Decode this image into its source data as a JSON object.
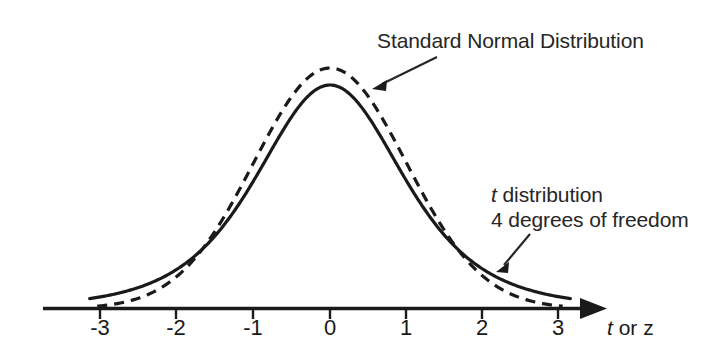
{
  "figure": {
    "background_color": "#ffffff",
    "ink_color": "#1a1a1a",
    "axis_title": "t or z",
    "axis_title_italic_part": "t",
    "axis_title_rest": " or z"
  },
  "annotations": {
    "normal_label": "Standard Normal Distribution",
    "t_label_line1_italic": "t",
    "t_label_line1_rest": " distribution",
    "t_label_line2": "4 degrees of freedom"
  },
  "chart_data": {
    "type": "line",
    "title": "",
    "subtitle": "",
    "xlabel": "t or z",
    "ylabel": "",
    "xlim": [
      -3.35,
      3.6
    ],
    "ylim": [
      0,
      0.435
    ],
    "grid": false,
    "legend_position": "annotations",
    "x_ticks": [
      -3,
      -2,
      -1,
      0,
      1,
      2,
      3
    ],
    "x_tick_labels": [
      "-3",
      "-2",
      "-1",
      "0",
      "1",
      "2",
      "3"
    ],
    "y_ticks": [],
    "series": [
      {
        "name": "Standard Normal Distribution",
        "style": "dashed",
        "peak_value": 0.3989,
        "x": [
          -3.2,
          -3.0,
          -2.8,
          -2.6,
          -2.4,
          -2.2,
          -2.0,
          -1.8,
          -1.6,
          -1.4,
          -1.2,
          -1.0,
          -0.8,
          -0.6,
          -0.4,
          -0.2,
          0.0,
          0.2,
          0.4,
          0.6,
          0.8,
          1.0,
          1.2,
          1.4,
          1.6,
          1.8,
          2.0,
          2.2,
          2.4,
          2.6,
          2.8,
          3.0,
          3.2
        ],
        "values": [
          0.0024,
          0.0044,
          0.0079,
          0.0136,
          0.0224,
          0.0355,
          0.054,
          0.079,
          0.1109,
          0.1497,
          0.1942,
          0.242,
          0.2897,
          0.3332,
          0.3683,
          0.391,
          0.3989,
          0.391,
          0.3683,
          0.3332,
          0.2897,
          0.242,
          0.1942,
          0.1497,
          0.1109,
          0.079,
          0.054,
          0.0355,
          0.0224,
          0.0136,
          0.0079,
          0.0044,
          0.0024
        ]
      },
      {
        "name": "t distribution, 4 degrees of freedom",
        "style": "solid",
        "degrees_of_freedom": 4,
        "peak_value": 0.375,
        "x": [
          -3.2,
          -3.0,
          -2.8,
          -2.6,
          -2.4,
          -2.2,
          -2.0,
          -1.8,
          -1.6,
          -1.4,
          -1.2,
          -1.0,
          -0.8,
          -0.6,
          -0.4,
          -0.2,
          0.0,
          0.2,
          0.4,
          0.6,
          0.8,
          1.0,
          1.2,
          1.4,
          1.6,
          1.8,
          2.0,
          2.2,
          2.4,
          2.6,
          2.8,
          3.0,
          3.2
        ],
        "values": [
          0.0114,
          0.0152,
          0.0204,
          0.0274,
          0.0369,
          0.0497,
          0.0663,
          0.0872,
          0.1123,
          0.1404,
          0.1693,
          0.1995,
          0.2295,
          0.2564,
          0.2776,
          0.2909,
          0.375,
          0.2909,
          0.2776,
          0.2564,
          0.2295,
          0.1995,
          0.1693,
          0.1404,
          0.1123,
          0.0872,
          0.0663,
          0.0497,
          0.0369,
          0.0274,
          0.0204,
          0.0152,
          0.0114
        ]
      }
    ]
  }
}
